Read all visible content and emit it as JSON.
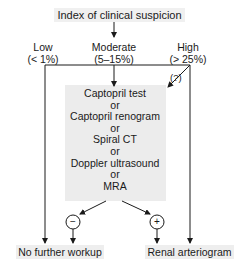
{
  "title": "Index of clinical suspicion",
  "tiers": [
    {
      "name": "Low",
      "range": "(< 1%)"
    },
    {
      "name": "Moderate",
      "range": "(5–15%)"
    },
    {
      "name": "High",
      "range": "(> 25%)"
    }
  ],
  "uncertain_label": "(?)",
  "tests": [
    "Captopril test",
    "or",
    "Captopril renogram",
    "or",
    "Spiral CT",
    "or",
    "Doppler ultrasound",
    "or",
    "MRA"
  ],
  "results": {
    "negative": "−",
    "positive": "+"
  },
  "outcomes": {
    "negative": "No further workup",
    "positive": "Renal arteriogram"
  },
  "colors": {
    "line": "#1a1a1a",
    "box_fill": "#ececec"
  }
}
